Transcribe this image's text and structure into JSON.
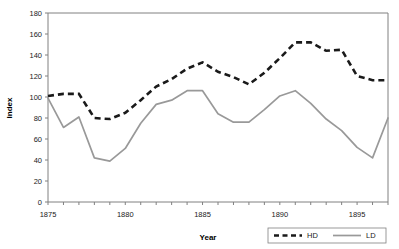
{
  "chart_data": {
    "type": "line",
    "title": "",
    "xlabel": "Year",
    "ylabel": "Index",
    "xlim": [
      1875,
      1897
    ],
    "ylim": [
      0,
      180
    ],
    "ytick_step": 20,
    "yticks": [
      0,
      20,
      40,
      60,
      80,
      100,
      120,
      140,
      160,
      180
    ],
    "xticks_major": [
      1875,
      1880,
      1885,
      1890,
      1895
    ],
    "xticks_minor_step": 1,
    "grid": false,
    "legend_position": "bottom-right",
    "x": [
      1875,
      1876,
      1877,
      1878,
      1879,
      1880,
      1881,
      1882,
      1883,
      1884,
      1885,
      1886,
      1887,
      1888,
      1889,
      1890,
      1891,
      1892,
      1893,
      1894,
      1895,
      1896,
      1897
    ],
    "series": [
      {
        "name": "HD",
        "style": "dashed",
        "color": "#1a1a1a",
        "values": [
          101,
          103,
          103,
          80,
          79,
          85,
          97,
          110,
          117,
          127,
          133,
          124,
          119,
          112,
          123,
          137,
          152,
          152,
          144,
          145,
          120,
          116,
          116
        ]
      },
      {
        "name": "LD",
        "style": "solid",
        "color": "#999999",
        "values": [
          99,
          71,
          81,
          42,
          39,
          51,
          75,
          93,
          97,
          106,
          106,
          84,
          76,
          76,
          88,
          101,
          106,
          94,
          79,
          68,
          52,
          42,
          80
        ]
      }
    ],
    "legend": [
      {
        "label": "HD",
        "style": "dashed",
        "color": "#1a1a1a"
      },
      {
        "label": "LD",
        "style": "solid",
        "color": "#999999"
      }
    ]
  }
}
